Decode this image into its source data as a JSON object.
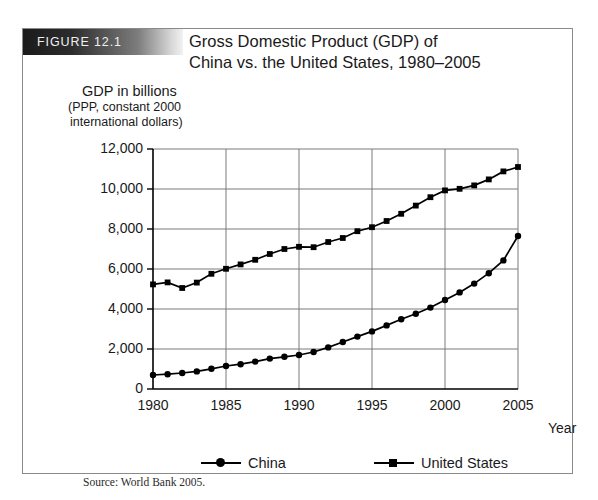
{
  "figure": {
    "label": "FIGURE 12.1",
    "title_line1": "Gross Domestic Product (GDP) of",
    "title_line2": "China vs. the United States, 1980–2005",
    "source": "Source: World Bank 2005."
  },
  "axis_caption": {
    "main": "GDP in billions",
    "sub1": "(PPP, constant 2000",
    "sub2": "international dollars)",
    "xlabel": "Year"
  },
  "legend": {
    "china_label": "China",
    "usa_label": "United States"
  },
  "chart_data": {
    "type": "line",
    "title": "Gross Domestic Product (GDP) of China vs. the United States, 1980–2005",
    "xlabel": "Year",
    "ylabel": "GDP in billions (PPP, constant 2000 international dollars)",
    "xlim": [
      1980,
      2005
    ],
    "ylim": [
      0,
      12000
    ],
    "xticks": [
      "1980",
      "1985",
      "1990",
      "1995",
      "2000",
      "2005"
    ],
    "xtick_values": [
      1980,
      1985,
      1990,
      1995,
      2000,
      2005
    ],
    "yticks": [
      "0",
      "2,000",
      "4,000",
      "6,000",
      "8,000",
      "10,000",
      "12,000"
    ],
    "ytick_values": [
      0,
      2000,
      4000,
      6000,
      8000,
      10000,
      12000
    ],
    "grid": true,
    "legend_position": "below",
    "x": [
      1980,
      1981,
      1982,
      1983,
      1984,
      1985,
      1986,
      1987,
      1988,
      1989,
      1990,
      1991,
      1992,
      1993,
      1994,
      1995,
      1996,
      1997,
      1998,
      1999,
      2000,
      2001,
      2002,
      2003,
      2004,
      2005
    ],
    "series": [
      {
        "name": "China",
        "marker": "circle",
        "values": [
          700,
          740,
          800,
          880,
          1010,
          1150,
          1240,
          1370,
          1520,
          1610,
          1700,
          1850,
          2080,
          2350,
          2620,
          2880,
          3180,
          3490,
          3760,
          4070,
          4450,
          4830,
          5270,
          5790,
          6430,
          7650
        ]
      },
      {
        "name": "United States",
        "marker": "square",
        "values": [
          5230,
          5330,
          5050,
          5320,
          5760,
          6010,
          6230,
          6460,
          6750,
          7000,
          7110,
          7090,
          7350,
          7550,
          7890,
          8090,
          8400,
          8760,
          9170,
          9590,
          9930,
          10010,
          10180,
          10480,
          10880,
          11100
        ]
      }
    ]
  }
}
